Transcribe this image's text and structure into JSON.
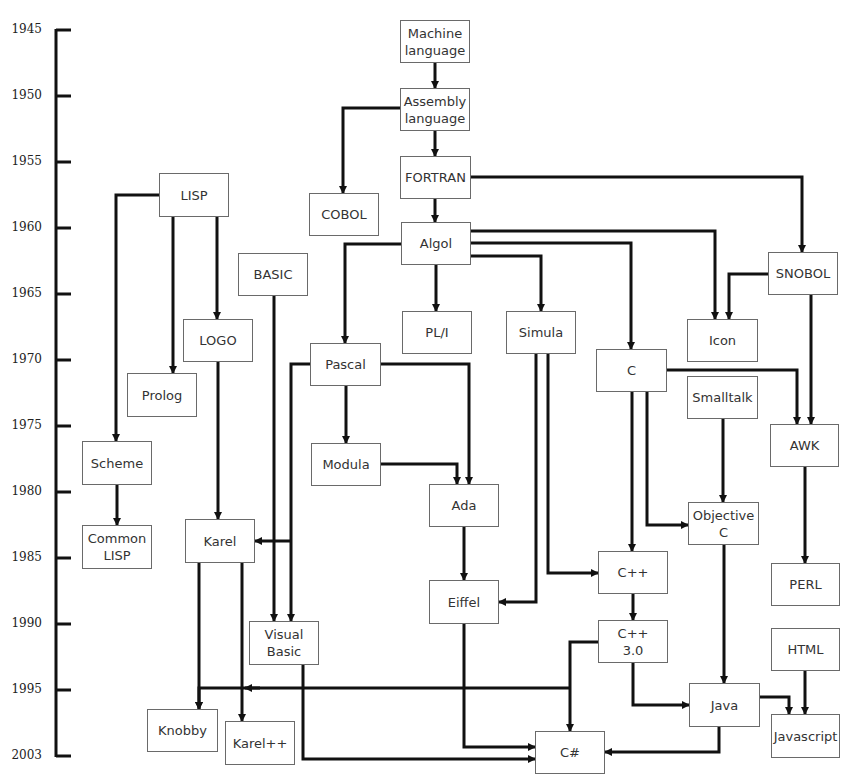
{
  "timeline": {
    "years": [
      {
        "label": "1945",
        "y": 30
      },
      {
        "label": "1950",
        "y": 96
      },
      {
        "label": "1955",
        "y": 162
      },
      {
        "label": "1960",
        "y": 228
      },
      {
        "label": "1965",
        "y": 294
      },
      {
        "label": "1970",
        "y": 360
      },
      {
        "label": "1975",
        "y": 426
      },
      {
        "label": "1980",
        "y": 492
      },
      {
        "label": "1985",
        "y": 558
      },
      {
        "label": "1990",
        "y": 624
      },
      {
        "label": "1995",
        "y": 690
      },
      {
        "label": "2003",
        "y": 756
      }
    ]
  },
  "nodes": {
    "machine": {
      "label": "Machine\nlanguage",
      "x": 400,
      "y": 20,
      "w": 70,
      "h": 43
    },
    "assembly": {
      "label": "Assembly\nlanguage",
      "x": 400,
      "y": 88,
      "w": 70,
      "h": 43
    },
    "fortran": {
      "label": "FORTRAN",
      "x": 400,
      "y": 156,
      "w": 71,
      "h": 43
    },
    "cobol": {
      "label": "COBOL",
      "x": 309,
      "y": 193,
      "w": 70,
      "h": 43
    },
    "algol": {
      "label": "Algol",
      "x": 401,
      "y": 222,
      "w": 70,
      "h": 43
    },
    "lisp": {
      "label": "LISP",
      "x": 159,
      "y": 173,
      "w": 70,
      "h": 44
    },
    "basic": {
      "label": "BASIC",
      "x": 238,
      "y": 253,
      "w": 70,
      "h": 43
    },
    "logo": {
      "label": "LOGO",
      "x": 183,
      "y": 319,
      "w": 70,
      "h": 43
    },
    "prolog": {
      "label": "Prolog",
      "x": 127,
      "y": 373,
      "w": 70,
      "h": 44
    },
    "pli": {
      "label": "PL/I",
      "x": 402,
      "y": 311,
      "w": 70,
      "h": 43
    },
    "simula": {
      "label": "Simula",
      "x": 506,
      "y": 311,
      "w": 70,
      "h": 43
    },
    "pascal": {
      "label": "Pascal",
      "x": 310,
      "y": 343,
      "w": 71,
      "h": 43
    },
    "snobol": {
      "label": "SNOBOL",
      "x": 768,
      "y": 252,
      "w": 70,
      "h": 43
    },
    "icon": {
      "label": "Icon",
      "x": 687,
      "y": 319,
      "w": 71,
      "h": 43
    },
    "c": {
      "label": "C",
      "x": 596,
      "y": 349,
      "w": 71,
      "h": 43
    },
    "smalltalk": {
      "label": "Smalltalk",
      "x": 687,
      "y": 376,
      "w": 71,
      "h": 43
    },
    "awk": {
      "label": "AWK",
      "x": 770,
      "y": 424,
      "w": 69,
      "h": 43
    },
    "modula": {
      "label": "Modula",
      "x": 311,
      "y": 443,
      "w": 70,
      "h": 43
    },
    "scheme": {
      "label": "Scheme",
      "x": 82,
      "y": 441,
      "w": 70,
      "h": 44
    },
    "ada": {
      "label": "Ada",
      "x": 429,
      "y": 484,
      "w": 70,
      "h": 43
    },
    "objc": {
      "label": "Objective\nC",
      "x": 688,
      "y": 502,
      "w": 71,
      "h": 43
    },
    "commonlisp": {
      "label": "Common\nLISP",
      "x": 82,
      "y": 525,
      "w": 70,
      "h": 44
    },
    "karel": {
      "label": "Karel",
      "x": 185,
      "y": 519,
      "w": 70,
      "h": 44
    },
    "cpp": {
      "label": "C++",
      "x": 598,
      "y": 551,
      "w": 70,
      "h": 43
    },
    "perl": {
      "label": "PERL",
      "x": 771,
      "y": 563,
      "w": 69,
      "h": 43
    },
    "eiffel": {
      "label": "Eiffel",
      "x": 429,
      "y": 580,
      "w": 70,
      "h": 44
    },
    "vb": {
      "label": "Visual\nBasic",
      "x": 249,
      "y": 621,
      "w": 70,
      "h": 44
    },
    "cpp30": {
      "label": "C++\n3.0",
      "x": 598,
      "y": 620,
      "w": 70,
      "h": 43
    },
    "html": {
      "label": "HTML",
      "x": 771,
      "y": 628,
      "w": 69,
      "h": 43
    },
    "java": {
      "label": "Java",
      "x": 689,
      "y": 683,
      "w": 71,
      "h": 44
    },
    "knobby": {
      "label": "Knobby",
      "x": 147,
      "y": 709,
      "w": 71,
      "h": 43
    },
    "javascript": {
      "label": "Javascript",
      "x": 771,
      "y": 714,
      "w": 69,
      "h": 44
    },
    "karelpp": {
      "label": "Karel++",
      "x": 225,
      "y": 721,
      "w": 70,
      "h": 44
    },
    "csharp": {
      "label": "C#",
      "x": 535,
      "y": 731,
      "w": 70,
      "h": 43
    }
  },
  "edges": [
    {
      "from": "machine",
      "to": "assembly",
      "points": [
        [
          435,
          63
        ],
        [
          435,
          88
        ]
      ]
    },
    {
      "from": "assembly",
      "to": "fortran",
      "points": [
        [
          435,
          131
        ],
        [
          435,
          156
        ]
      ]
    },
    {
      "from": "assembly",
      "to": "cobol",
      "points": [
        [
          400,
          108
        ],
        [
          343,
          108
        ],
        [
          343,
          193
        ]
      ]
    },
    {
      "from": "fortran",
      "to": "algol",
      "points": [
        [
          435,
          199
        ],
        [
          435,
          222
        ]
      ]
    },
    {
      "from": "fortran",
      "to": "snobol",
      "points": [
        [
          471,
          177
        ],
        [
          802,
          177
        ],
        [
          802,
          252
        ]
      ]
    },
    {
      "from": "algol",
      "to": "icon",
      "points": [
        [
          471,
          231
        ],
        [
          715,
          231
        ],
        [
          715,
          319
        ]
      ]
    },
    {
      "from": "algol",
      "to": "c",
      "points": [
        [
          471,
          243
        ],
        [
          631,
          243
        ],
        [
          631,
          349
        ]
      ]
    },
    {
      "from": "algol",
      "to": "simula",
      "points": [
        [
          471,
          256
        ],
        [
          541,
          256
        ],
        [
          541,
          311
        ]
      ]
    },
    {
      "from": "algol",
      "to": "pli",
      "points": [
        [
          436,
          265
        ],
        [
          436,
          311
        ]
      ]
    },
    {
      "from": "algol",
      "to": "pascal",
      "points": [
        [
          401,
          244
        ],
        [
          345,
          244
        ],
        [
          345,
          343
        ]
      ]
    },
    {
      "from": "snobol",
      "to": "icon",
      "points": [
        [
          768,
          274
        ],
        [
          729,
          274
        ],
        [
          729,
          319
        ]
      ]
    },
    {
      "from": "snobol",
      "to": "awk",
      "points": [
        [
          811,
          295
        ],
        [
          811,
          424
        ]
      ]
    },
    {
      "from": "c",
      "to": "awk",
      "points": [
        [
          667,
          370
        ],
        [
          797,
          370
        ],
        [
          797,
          424
        ]
      ]
    },
    {
      "from": "lisp",
      "to": "scheme",
      "points": [
        [
          159,
          195
        ],
        [
          116,
          195
        ],
        [
          116,
          441
        ]
      ]
    },
    {
      "from": "lisp",
      "to": "prolog",
      "points": [
        [
          173,
          217
        ],
        [
          173,
          373
        ]
      ]
    },
    {
      "from": "lisp",
      "to": "logo",
      "points": [
        [
          217,
          217
        ],
        [
          217,
          319
        ]
      ]
    },
    {
      "from": "logo",
      "to": "karel",
      "points": [
        [
          218,
          362
        ],
        [
          218,
          519
        ]
      ]
    },
    {
      "from": "basic",
      "to": "vb",
      "points": [
        [
          274,
          296
        ],
        [
          274,
          621
        ]
      ]
    },
    {
      "from": "pascal",
      "to": "vb",
      "points": [
        [
          310,
          364
        ],
        [
          291,
          364
        ],
        [
          291,
          621
        ]
      ]
    },
    {
      "from": "pascal",
      "to": "karel",
      "points": [
        [
          291,
          541
        ],
        [
          255,
          541
        ]
      ]
    },
    {
      "from": "pascal",
      "to": "modula",
      "points": [
        [
          346,
          386
        ],
        [
          346,
          443
        ]
      ]
    },
    {
      "from": "pascal",
      "to": "ada",
      "points": [
        [
          381,
          364
        ],
        [
          469,
          364
        ],
        [
          469,
          484
        ]
      ]
    },
    {
      "from": "modula",
      "to": "ada",
      "points": [
        [
          381,
          464
        ],
        [
          457,
          464
        ],
        [
          457,
          484
        ]
      ]
    },
    {
      "from": "ada",
      "to": "eiffel",
      "points": [
        [
          464,
          527
        ],
        [
          464,
          580
        ]
      ]
    },
    {
      "from": "simula",
      "to": "eiffel",
      "points": [
        [
          536,
          354
        ],
        [
          536,
          602
        ],
        [
          499,
          602
        ]
      ]
    },
    {
      "from": "simula",
      "to": "cpp",
      "points": [
        [
          548,
          354
        ],
        [
          548,
          573
        ],
        [
          598,
          573
        ]
      ]
    },
    {
      "from": "scheme",
      "to": "commonlisp",
      "points": [
        [
          117,
          485
        ],
        [
          117,
          525
        ]
      ]
    },
    {
      "from": "c",
      "to": "cpp",
      "points": [
        [
          632,
          392
        ],
        [
          632,
          551
        ]
      ]
    },
    {
      "from": "c",
      "to": "objc",
      "points": [
        [
          647,
          392
        ],
        [
          647,
          525
        ],
        [
          688,
          525
        ]
      ]
    },
    {
      "from": "smalltalk",
      "to": "objc",
      "points": [
        [
          723,
          419
        ],
        [
          723,
          502
        ]
      ]
    },
    {
      "from": "awk",
      "to": "perl",
      "points": [
        [
          805,
          467
        ],
        [
          805,
          563
        ]
      ]
    },
    {
      "from": "cpp",
      "to": "cpp30",
      "points": [
        [
          633,
          594
        ],
        [
          633,
          620
        ]
      ]
    },
    {
      "from": "cpp30",
      "to": "java",
      "points": [
        [
          633,
          663
        ],
        [
          633,
          705
        ],
        [
          689,
          705
        ]
      ]
    },
    {
      "from": "cpp30",
      "to": "csharp",
      "points": [
        [
          598,
          642
        ],
        [
          570,
          642
        ],
        [
          570,
          731
        ]
      ]
    },
    {
      "from": "cpp30",
      "to": "knobby",
      "points": [
        [
          570,
          688
        ],
        [
          199,
          688
        ],
        [
          199,
          709
        ]
      ]
    },
    {
      "from": "cpp30",
      "to": "karelpp",
      "points": [
        [
          245,
          688
        ],
        [
          245,
          688
        ]
      ]
    },
    {
      "from": "karel",
      "to": "knobby",
      "points": [
        [
          199,
          563
        ],
        [
          199,
          709
        ]
      ]
    },
    {
      "from": "karel",
      "to": "karelpp",
      "points": [
        [
          242,
          563
        ],
        [
          242,
          721
        ]
      ]
    },
    {
      "from": "objc",
      "to": "java",
      "points": [
        [
          724,
          545
        ],
        [
          724,
          683
        ]
      ]
    },
    {
      "from": "java",
      "to": "javascript",
      "points": [
        [
          760,
          697
        ],
        [
          789,
          697
        ],
        [
          789,
          714
        ]
      ]
    },
    {
      "from": "html",
      "to": "javascript",
      "points": [
        [
          805,
          671
        ],
        [
          805,
          714
        ]
      ]
    },
    {
      "from": "java",
      "to": "csharp",
      "points": [
        [
          719,
          727
        ],
        [
          719,
          752
        ],
        [
          605,
          752
        ]
      ]
    },
    {
      "from": "eiffel",
      "to": "csharp",
      "points": [
        [
          464,
          624
        ],
        [
          464,
          747
        ],
        [
          535,
          747
        ]
      ]
    },
    {
      "from": "vb",
      "to": "csharp",
      "points": [
        [
          303,
          665
        ],
        [
          303,
          759
        ],
        [
          535,
          759
        ]
      ]
    }
  ],
  "colors": {
    "line": "#111111",
    "box_border": "#6a6a6a",
    "text": "#333333"
  }
}
